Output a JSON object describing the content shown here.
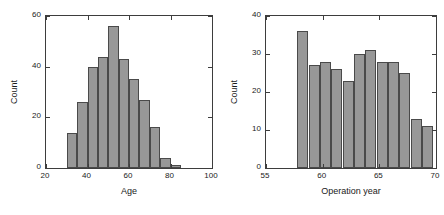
{
  "figure": {
    "background_color": "#ffffff",
    "bar_fill_color": "#989898",
    "bar_edge_color": "#4a4a4a",
    "axis_color": "#3d3d3d"
  },
  "chart_data": [
    {
      "type": "bar",
      "name": "age-histogram",
      "title": "",
      "xlabel": "Age",
      "ylabel": "Count",
      "xlim": [
        20,
        100
      ],
      "ylim": [
        0,
        60
      ],
      "grid": false,
      "legend": false,
      "xticks": [
        20,
        40,
        60,
        80,
        100
      ],
      "xtick_labels": [
        "20",
        "40",
        "60",
        "80",
        "100"
      ],
      "yticks": [
        0,
        20,
        40,
        60
      ],
      "ytick_labels": [
        "0",
        "20",
        "40",
        "60"
      ],
      "bin_width": 5,
      "bin_starts": [
        30,
        35,
        40,
        45,
        50,
        55,
        60,
        65,
        70,
        75,
        80
      ],
      "bin_edges": [
        30,
        35,
        40,
        45,
        50,
        55,
        60,
        65,
        70,
        75,
        80,
        85
      ],
      "categories": [
        "30-35",
        "35-40",
        "40-45",
        "45-50",
        "50-55",
        "55-60",
        "60-65",
        "65-70",
        "70-75",
        "75-80",
        "80-85"
      ],
      "values": [
        14,
        26,
        40,
        44,
        56,
        43,
        35,
        27,
        16,
        4,
        1
      ]
    },
    {
      "type": "bar",
      "name": "operation-year-histogram",
      "title": "",
      "xlabel": "Operation year",
      "ylabel": "Count",
      "xlim": [
        55,
        70
      ],
      "ylim": [
        0,
        40
      ],
      "grid": false,
      "legend": false,
      "xticks": [
        55,
        60,
        65,
        70
      ],
      "xtick_labels": [
        "55",
        "60",
        "65",
        "70"
      ],
      "yticks": [
        0,
        10,
        20,
        30,
        40
      ],
      "ytick_labels": [
        "0",
        "10",
        "20",
        "30",
        "40"
      ],
      "bin_width": 1,
      "bin_starts": [
        57.75,
        58.75,
        59.75,
        60.75,
        61.75,
        62.75,
        63.75,
        64.75,
        65.75,
        66.75,
        67.75,
        68.75
      ],
      "bin_edges": [
        57.75,
        58.75,
        59.75,
        60.75,
        61.75,
        62.75,
        63.75,
        64.75,
        65.75,
        66.75,
        67.75,
        68.75,
        69.75
      ],
      "categories": [
        "58",
        "59",
        "60",
        "61",
        "62",
        "63",
        "64",
        "65",
        "66",
        "67",
        "68",
        "69"
      ],
      "values": [
        36,
        27,
        28,
        26,
        23,
        30,
        31,
        28,
        28,
        25,
        13,
        11
      ]
    }
  ]
}
